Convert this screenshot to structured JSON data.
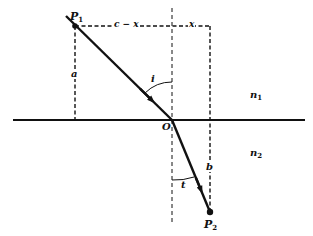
{
  "diagram": {
    "colors": {
      "line": "#111111",
      "background": "#ffffff"
    },
    "points": {
      "P1": {
        "label": "P",
        "sub": "1"
      },
      "O": {
        "label": "O"
      },
      "P2": {
        "label": "P",
        "sub": "2"
      }
    },
    "labels": {
      "c_minus_x": "c − x",
      "x": "x",
      "a": "a",
      "b": "b",
      "i": "i",
      "t": "t",
      "n1": {
        "label": "n",
        "sub": "1"
      },
      "n2": {
        "label": "n",
        "sub": "2"
      }
    }
  }
}
